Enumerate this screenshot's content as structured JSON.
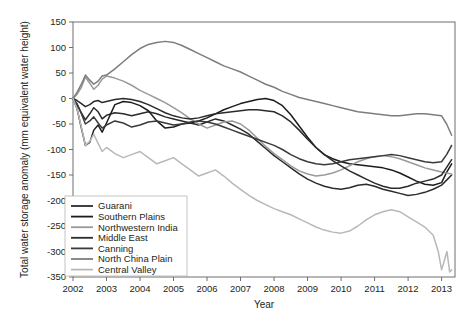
{
  "chart_data": {
    "type": "line",
    "title": "",
    "xlabel": "Year",
    "ylabel": "Total water storage anomaly (mm equivalent water height)",
    "xlim": [
      2002,
      2013.4
    ],
    "ylim": [
      -350,
      150
    ],
    "xticks": [
      "2002",
      "2003",
      "2004",
      "2005",
      "2006",
      "2007",
      "2008",
      "2009",
      "2010",
      "2011",
      "2012",
      "2013"
    ],
    "yticks": [
      "150",
      "100",
      "50",
      "0",
      "-50",
      "-100",
      "-150",
      "-200",
      "-250",
      "-300",
      "-350"
    ],
    "grid": false,
    "legend_position": "lower-left-inside",
    "series": [
      {
        "name": "Guarani",
        "color": "#2b2b2b",
        "x": [
          2002.0,
          2002.12,
          2002.25,
          2002.37,
          2002.5,
          2002.62,
          2002.75,
          2002.87,
          2003.0,
          2003.25,
          2003.5,
          2003.75,
          2004.0,
          2004.25,
          2004.5,
          2004.75,
          2005.0,
          2005.25,
          2005.5,
          2005.75,
          2006.0,
          2006.25,
          2006.5,
          2006.75,
          2007.0,
          2007.25,
          2007.5,
          2007.75,
          2008.0,
          2008.25,
          2008.5,
          2008.75,
          2009.0,
          2009.25,
          2009.5,
          2009.75,
          2010.0,
          2010.25,
          2010.5,
          2010.75,
          2011.0,
          2011.25,
          2011.5,
          2011.75,
          2012.0,
          2012.25,
          2012.5,
          2012.75,
          2013.0,
          2013.15,
          2013.3
        ],
        "y": [
          0,
          -12,
          -28,
          -42,
          -30,
          -18,
          -26,
          -40,
          -33,
          -28,
          -30,
          -34,
          -30,
          -26,
          -30,
          -36,
          -40,
          -44,
          -48,
          -52,
          -46,
          -40,
          -44,
          -52,
          -60,
          -70,
          -84,
          -98,
          -112,
          -124,
          -136,
          -148,
          -158,
          -166,
          -172,
          -176,
          -178,
          -175,
          -170,
          -168,
          -172,
          -178,
          -182,
          -186,
          -190,
          -188,
          -184,
          -178,
          -170,
          -160,
          -150
        ]
      },
      {
        "name": "Southern Plains",
        "color": "#1c1c1c",
        "x": [
          2002.0,
          2002.12,
          2002.25,
          2002.37,
          2002.5,
          2002.62,
          2002.75,
          2002.87,
          2003.0,
          2003.25,
          2003.5,
          2003.75,
          2004.0,
          2004.25,
          2004.5,
          2004.75,
          2005.0,
          2005.25,
          2005.5,
          2005.75,
          2006.0,
          2006.25,
          2006.5,
          2006.75,
          2007.0,
          2007.25,
          2007.5,
          2007.75,
          2008.0,
          2008.25,
          2008.5,
          2008.75,
          2009.0,
          2009.25,
          2009.5,
          2009.75,
          2010.0,
          2010.25,
          2010.5,
          2010.75,
          2011.0,
          2011.25,
          2011.5,
          2011.75,
          2012.0,
          2012.25,
          2012.5,
          2012.75,
          2013.0,
          2013.15,
          2013.3
        ],
        "y": [
          0,
          -20,
          -58,
          -92,
          -86,
          -62,
          -52,
          -66,
          -48,
          -12,
          -6,
          -8,
          -14,
          -24,
          -44,
          -58,
          -56,
          -50,
          -48,
          -44,
          -38,
          -30,
          -22,
          -16,
          -10,
          -6,
          -2,
          0,
          -4,
          -14,
          -32,
          -54,
          -76,
          -96,
          -110,
          -118,
          -124,
          -128,
          -130,
          -132,
          -134,
          -136,
          -140,
          -146,
          -154,
          -162,
          -168,
          -170,
          -165,
          -145,
          -128
        ]
      },
      {
        "name": "Northwestern India",
        "color": "#9a9a9a",
        "x": [
          2002.0,
          2002.12,
          2002.25,
          2002.37,
          2002.5,
          2002.62,
          2002.75,
          2002.87,
          2003.0,
          2003.25,
          2003.5,
          2003.75,
          2004.0,
          2004.25,
          2004.5,
          2004.75,
          2005.0,
          2005.25,
          2005.5,
          2005.75,
          2006.0,
          2006.25,
          2006.5,
          2006.75,
          2007.0,
          2007.25,
          2007.5,
          2007.75,
          2008.0,
          2008.25,
          2008.5,
          2008.75,
          2009.0,
          2009.25,
          2009.5,
          2009.75,
          2010.0,
          2010.25,
          2010.5,
          2010.75,
          2011.0,
          2011.25,
          2011.5,
          2011.75,
          2012.0,
          2012.25,
          2012.5,
          2012.75,
          2013.0,
          2013.15,
          2013.3
        ],
        "y": [
          0,
          8,
          22,
          42,
          30,
          18,
          26,
          38,
          44,
          40,
          34,
          26,
          16,
          8,
          0,
          -8,
          -18,
          -28,
          -40,
          -50,
          -58,
          -52,
          -46,
          -44,
          -50,
          -62,
          -78,
          -94,
          -108,
          -120,
          -132,
          -142,
          -148,
          -152,
          -150,
          -146,
          -140,
          -132,
          -124,
          -118,
          -114,
          -112,
          -114,
          -118,
          -124,
          -130,
          -136,
          -140,
          -144,
          -146,
          -148
        ]
      },
      {
        "name": "Middle East",
        "color": "#2b2b2b",
        "x": [
          2002.0,
          2002.12,
          2002.25,
          2002.37,
          2002.5,
          2002.62,
          2002.75,
          2002.87,
          2003.0,
          2003.25,
          2003.5,
          2003.75,
          2004.0,
          2004.25,
          2004.5,
          2004.75,
          2005.0,
          2005.25,
          2005.5,
          2005.75,
          2006.0,
          2006.25,
          2006.5,
          2006.75,
          2007.0,
          2007.25,
          2007.5,
          2007.75,
          2008.0,
          2008.25,
          2008.5,
          2008.75,
          2009.0,
          2009.25,
          2009.5,
          2009.75,
          2010.0,
          2010.25,
          2010.5,
          2010.75,
          2011.0,
          2011.25,
          2011.5,
          2011.75,
          2012.0,
          2012.25,
          2012.5,
          2012.75,
          2013.0,
          2013.15,
          2013.3
        ],
        "y": [
          0,
          -4,
          -10,
          -16,
          -12,
          -6,
          -4,
          -8,
          -6,
          -2,
          0,
          -2,
          -6,
          -12,
          -20,
          -28,
          -34,
          -38,
          -40,
          -38,
          -34,
          -30,
          -28,
          -26,
          -24,
          -22,
          -22,
          -24,
          -26,
          -34,
          -46,
          -62,
          -80,
          -96,
          -110,
          -122,
          -132,
          -142,
          -150,
          -158,
          -166,
          -172,
          -176,
          -176,
          -172,
          -166,
          -162,
          -158,
          -150,
          -135,
          -120
        ]
      },
      {
        "name": "Canning",
        "color": "#3a3a3a",
        "x": [
          2002.0,
          2002.12,
          2002.25,
          2002.37,
          2002.5,
          2002.62,
          2002.75,
          2002.87,
          2003.0,
          2003.25,
          2003.5,
          2003.75,
          2004.0,
          2004.25,
          2004.5,
          2004.75,
          2005.0,
          2005.25,
          2005.5,
          2005.75,
          2006.0,
          2006.25,
          2006.5,
          2006.75,
          2007.0,
          2007.25,
          2007.5,
          2007.75,
          2008.0,
          2008.25,
          2008.5,
          2008.75,
          2009.0,
          2009.25,
          2009.5,
          2009.75,
          2010.0,
          2010.25,
          2010.5,
          2010.75,
          2011.0,
          2011.25,
          2011.5,
          2011.75,
          2012.0,
          2012.25,
          2012.5,
          2012.75,
          2013.0,
          2013.15,
          2013.3
        ],
        "y": [
          0,
          -10,
          -30,
          -50,
          -44,
          -36,
          -48,
          -58,
          -52,
          -44,
          -48,
          -56,
          -52,
          -46,
          -44,
          -48,
          -52,
          -50,
          -46,
          -44,
          -46,
          -50,
          -56,
          -62,
          -68,
          -74,
          -80,
          -86,
          -92,
          -100,
          -110,
          -118,
          -124,
          -128,
          -130,
          -128,
          -124,
          -120,
          -118,
          -116,
          -114,
          -112,
          -110,
          -112,
          -116,
          -120,
          -124,
          -126,
          -124,
          -110,
          -92
        ]
      },
      {
        "name": "North China Plain",
        "color": "#7d7d7d",
        "x": [
          2002.0,
          2002.12,
          2002.25,
          2002.37,
          2002.5,
          2002.62,
          2002.75,
          2002.87,
          2003.0,
          2003.25,
          2003.5,
          2003.75,
          2004.0,
          2004.25,
          2004.5,
          2004.75,
          2005.0,
          2005.25,
          2005.5,
          2005.75,
          2006.0,
          2006.25,
          2006.5,
          2006.75,
          2007.0,
          2007.25,
          2007.5,
          2007.75,
          2008.0,
          2008.25,
          2008.5,
          2008.75,
          2009.0,
          2009.25,
          2009.5,
          2009.75,
          2010.0,
          2010.25,
          2010.5,
          2010.75,
          2011.0,
          2011.25,
          2011.5,
          2011.75,
          2012.0,
          2012.25,
          2012.5,
          2012.75,
          2013.0,
          2013.15,
          2013.3
        ],
        "y": [
          0,
          12,
          28,
          46,
          36,
          28,
          34,
          44,
          46,
          58,
          72,
          86,
          98,
          106,
          110,
          112,
          110,
          104,
          96,
          88,
          80,
          72,
          64,
          58,
          52,
          44,
          36,
          28,
          22,
          14,
          8,
          2,
          -2,
          -6,
          -10,
          -14,
          -18,
          -22,
          -26,
          -28,
          -30,
          -32,
          -34,
          -34,
          -32,
          -30,
          -30,
          -32,
          -34,
          -50,
          -72
        ]
      },
      {
        "name": "Central Valley",
        "color": "#b8b8b8",
        "x": [
          2002.0,
          2002.12,
          2002.25,
          2002.37,
          2002.5,
          2002.62,
          2002.75,
          2002.87,
          2003.0,
          2003.25,
          2003.5,
          2003.75,
          2004.0,
          2004.25,
          2004.5,
          2004.75,
          2005.0,
          2005.25,
          2005.5,
          2005.75,
          2006.0,
          2006.25,
          2006.5,
          2006.75,
          2007.0,
          2007.25,
          2007.5,
          2007.75,
          2008.0,
          2008.25,
          2008.5,
          2008.75,
          2009.0,
          2009.25,
          2009.5,
          2009.75,
          2010.0,
          2010.25,
          2010.5,
          2010.75,
          2011.0,
          2011.25,
          2011.5,
          2011.75,
          2012.0,
          2012.25,
          2012.5,
          2012.75,
          2012.9,
          2013.0,
          2013.08,
          2013.16,
          2013.24,
          2013.3
        ],
        "y": [
          0,
          -20,
          -56,
          -92,
          -84,
          -70,
          -88,
          -104,
          -96,
          -108,
          -116,
          -110,
          -104,
          -116,
          -128,
          -122,
          -116,
          -128,
          -140,
          -152,
          -146,
          -140,
          -152,
          -166,
          -178,
          -190,
          -200,
          -208,
          -216,
          -222,
          -228,
          -236,
          -244,
          -252,
          -258,
          -262,
          -264,
          -260,
          -250,
          -238,
          -228,
          -222,
          -218,
          -222,
          -232,
          -242,
          -252,
          -268,
          -300,
          -336,
          -318,
          -300,
          -340,
          -336
        ]
      }
    ]
  },
  "legend": {
    "items": [
      {
        "label": "Guarani"
      },
      {
        "label": "Southern Plains"
      },
      {
        "label": "Northwestern India"
      },
      {
        "label": "Middle East"
      },
      {
        "label": "Canning"
      },
      {
        "label": "North China Plain"
      },
      {
        "label": "Central Valley"
      }
    ]
  }
}
